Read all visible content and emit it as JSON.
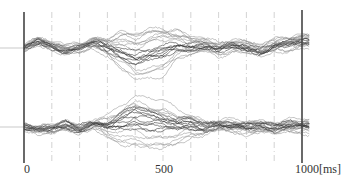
{
  "chart_data": {
    "type": "line",
    "title": "",
    "xlabel": "[ms]",
    "ylabel": "",
    "x_range_ms": [
      0,
      1000
    ],
    "grid": {
      "vertical_dashed_every_ms": 100
    },
    "legend": null,
    "x_tick_labels": [
      {
        "value": 0,
        "label": "0"
      },
      {
        "value": 500,
        "label": "500"
      },
      {
        "value": 1000,
        "label": "1000[ms]"
      }
    ],
    "panels": [
      {
        "name": "top-waveforms",
        "baseline_px": 48,
        "description": "~20 overlaid waveform traces; tight bundle 0-300ms, spread (approx +30/-30 px) around 300-550ms, converging toward 1000ms",
        "mean_trace": {
          "x_ms": [
            0,
            50,
            100,
            150,
            200,
            250,
            300,
            350,
            400,
            450,
            500,
            550,
            600,
            650,
            700,
            750,
            800,
            850,
            900,
            950,
            1000
          ],
          "offset_px": [
            0,
            -6,
            -2,
            2,
            0,
            -5,
            0,
            4,
            10,
            6,
            4,
            -2,
            -1,
            -3,
            2,
            -2,
            0,
            3,
            -2,
            -4,
            -6
          ]
        },
        "spread_px": [
          2,
          3,
          3,
          3,
          3,
          4,
          8,
          18,
          22,
          24,
          22,
          14,
          8,
          6,
          5,
          5,
          5,
          5,
          5,
          6,
          6
        ]
      },
      {
        "name": "bottom-waveforms",
        "baseline_px": 127,
        "description": "~20 overlaid waveform traces; tight bundle 0-300ms, large spread (approx -35/+35 px) around 300-600ms, converging toward 1000ms",
        "mean_trace": {
          "x_ms": [
            0,
            50,
            100,
            150,
            200,
            250,
            300,
            350,
            400,
            450,
            500,
            550,
            600,
            650,
            700,
            750,
            800,
            850,
            900,
            950,
            1000
          ],
          "offset_px": [
            0,
            3,
            1,
            -2,
            2,
            -3,
            -1,
            -5,
            -10,
            -6,
            -4,
            -2,
            -3,
            0,
            -2,
            -1,
            0,
            -2,
            1,
            -2,
            -1
          ]
        },
        "spread_px": [
          2,
          3,
          3,
          4,
          4,
          5,
          10,
          22,
          28,
          30,
          26,
          18,
          12,
          8,
          6,
          6,
          6,
          5,
          6,
          7,
          7
        ]
      }
    ]
  },
  "colors": {
    "axis": "#444444",
    "grid": "#c8c8c8",
    "trace": "#555555",
    "baseline_tick": "#bbbbbb",
    "label": "#333333"
  }
}
